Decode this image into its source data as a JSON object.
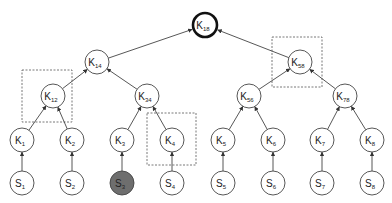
{
  "diagram": {
    "type": "key-tree",
    "colors": {
      "stroke": "#444444",
      "fill": "#ffffff",
      "highlight_fill": "#6e6e6e",
      "dashed_box": "#555555"
    },
    "nodes": [
      {
        "id": "K18",
        "letter": "K",
        "sub": "18",
        "x": 205,
        "y": 25,
        "root": true
      },
      {
        "id": "K14",
        "letter": "K",
        "sub": "14",
        "x": 97,
        "y": 62
      },
      {
        "id": "K58",
        "letter": "K",
        "sub": "58",
        "x": 300,
        "y": 62
      },
      {
        "id": "K12",
        "letter": "K",
        "sub": "12",
        "x": 53,
        "y": 96
      },
      {
        "id": "K34",
        "letter": "K",
        "sub": "34",
        "x": 147,
        "y": 96
      },
      {
        "id": "K56",
        "letter": "K",
        "sub": "56",
        "x": 249,
        "y": 96
      },
      {
        "id": "K78",
        "letter": "K",
        "sub": "78",
        "x": 345,
        "y": 96
      },
      {
        "id": "K1",
        "letter": "K",
        "sub": "1",
        "x": 22,
        "y": 140
      },
      {
        "id": "K2",
        "letter": "K",
        "sub": "2",
        "x": 72,
        "y": 140
      },
      {
        "id": "K3",
        "letter": "K",
        "sub": "3",
        "x": 122,
        "y": 140
      },
      {
        "id": "K4",
        "letter": "K",
        "sub": "4",
        "x": 172,
        "y": 140
      },
      {
        "id": "K5",
        "letter": "K",
        "sub": "5",
        "x": 223,
        "y": 140
      },
      {
        "id": "K6",
        "letter": "K",
        "sub": "6",
        "x": 273,
        "y": 140
      },
      {
        "id": "K7",
        "letter": "K",
        "sub": "7",
        "x": 322,
        "y": 140
      },
      {
        "id": "K8",
        "letter": "K",
        "sub": "8",
        "x": 372,
        "y": 140
      },
      {
        "id": "S1",
        "letter": "S",
        "sub": "1",
        "x": 22,
        "y": 183
      },
      {
        "id": "S2",
        "letter": "S",
        "sub": "2",
        "x": 72,
        "y": 183
      },
      {
        "id": "S3",
        "letter": "S",
        "sub": "3",
        "x": 122,
        "y": 183,
        "shaded": true
      },
      {
        "id": "S4",
        "letter": "S",
        "sub": "4",
        "x": 172,
        "y": 183
      },
      {
        "id": "S5",
        "letter": "S",
        "sub": "5",
        "x": 223,
        "y": 183
      },
      {
        "id": "S6",
        "letter": "S",
        "sub": "6",
        "x": 273,
        "y": 183
      },
      {
        "id": "S7",
        "letter": "S",
        "sub": "7",
        "x": 322,
        "y": 183
      },
      {
        "id": "S8",
        "letter": "S",
        "sub": "8",
        "x": 372,
        "y": 183
      }
    ],
    "edges": [
      {
        "from": "K14",
        "to": "K18"
      },
      {
        "from": "K58",
        "to": "K18"
      },
      {
        "from": "K12",
        "to": "K14"
      },
      {
        "from": "K34",
        "to": "K14"
      },
      {
        "from": "K56",
        "to": "K58"
      },
      {
        "from": "K78",
        "to": "K58"
      },
      {
        "from": "K1",
        "to": "K12"
      },
      {
        "from": "K2",
        "to": "K12"
      },
      {
        "from": "K3",
        "to": "K34"
      },
      {
        "from": "K4",
        "to": "K34"
      },
      {
        "from": "K5",
        "to": "K56"
      },
      {
        "from": "K6",
        "to": "K56"
      },
      {
        "from": "K7",
        "to": "K78"
      },
      {
        "from": "K8",
        "to": "K78"
      },
      {
        "from": "S1",
        "to": "K1"
      },
      {
        "from": "S2",
        "to": "K2"
      },
      {
        "from": "S3",
        "to": "K3"
      },
      {
        "from": "S4",
        "to": "K4"
      },
      {
        "from": "S5",
        "to": "K5"
      },
      {
        "from": "S6",
        "to": "K6"
      },
      {
        "from": "S7",
        "to": "K7"
      },
      {
        "from": "S8",
        "to": "K8"
      }
    ],
    "dashed_boxes": [
      {
        "id": "box-K12",
        "x": 22,
        "y": 70,
        "w": 50,
        "h": 52
      },
      {
        "id": "box-K58",
        "x": 272,
        "y": 37,
        "w": 50,
        "h": 50
      },
      {
        "id": "box-K4",
        "x": 147,
        "y": 113,
        "w": 49,
        "h": 52
      }
    ],
    "node_radius": 12
  }
}
